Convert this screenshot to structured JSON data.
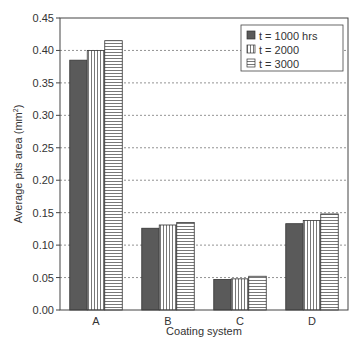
{
  "chart_data": {
    "type": "bar",
    "title": "",
    "xlabel": "Coating system",
    "ylabel": "Average pits area (mm²)",
    "ylabel_main": "Average pits area (mm",
    "ylabel_sup": "2",
    "ylabel_close": ")",
    "categories": [
      "A",
      "B",
      "C",
      "D"
    ],
    "series": [
      {
        "name": "t = 1000 hrs",
        "pattern": "solid-dark",
        "values": [
          0.385,
          0.126,
          0.047,
          0.133
        ]
      },
      {
        "name": "t = 2000",
        "pattern": "vertical-lines",
        "values": [
          0.4,
          0.131,
          0.048,
          0.138
        ]
      },
      {
        "name": "t = 3000",
        "pattern": "horizontal-lines",
        "values": [
          0.415,
          0.135,
          0.052,
          0.148
        ]
      }
    ],
    "ylim": [
      0,
      0.45
    ],
    "yticks": [
      "0.00",
      "0.05",
      "0.10",
      "0.15",
      "0.20",
      "0.25",
      "0.30",
      "0.35",
      "0.40",
      "0.45"
    ],
    "grid": "horizontal dotted",
    "legend_position": "upper right"
  },
  "colors": {
    "axis": "#444444",
    "bar_dark": "#5a5a5a",
    "bar_outline": "#333333",
    "hatch": "#555555",
    "grid": "#777777"
  }
}
